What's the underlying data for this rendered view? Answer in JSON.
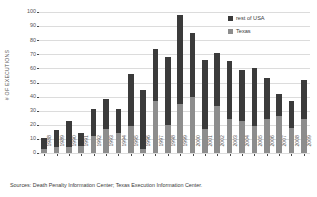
{
  "chart_data": {
    "type": "bar",
    "subtype": "stacked-bar",
    "title": "",
    "xlabel": "",
    "ylabel": "# OF EXECUTIONS",
    "ylim": [
      0,
      100
    ],
    "ytick_step": 10,
    "yticks": [
      100,
      90,
      80,
      70,
      60,
      50,
      40,
      30,
      20,
      10,
      0
    ],
    "grid": "horizontal",
    "legend_position": "top-right-inside",
    "categories": [
      "1988",
      "1989",
      "1990",
      "1991",
      "1992",
      "1993",
      "1994",
      "1995",
      "1996",
      "1997",
      "1998",
      "1999",
      "2000",
      "2001",
      "2002",
      "2003",
      "2004",
      "2005",
      "2006",
      "2007",
      "2008",
      "2009"
    ],
    "series": [
      {
        "name": "Texas",
        "color": "#8d8d8d",
        "values": [
          3,
          4,
          4,
          5,
          12,
          17,
          14,
          19,
          3,
          37,
          20,
          35,
          40,
          17,
          33,
          24,
          23,
          19,
          24,
          26,
          18,
          24
        ]
      },
      {
        "name": "rest of USA",
        "color": "#3b3b3b",
        "values": [
          8,
          12,
          19,
          9,
          19,
          21,
          17,
          37,
          42,
          37,
          48,
          63,
          45,
          49,
          38,
          41,
          36,
          41,
          29,
          16,
          19,
          28
        ]
      }
    ],
    "totals": [
      11,
      16,
      23,
      14,
      31,
      38,
      31,
      56,
      45,
      74,
      68,
      98,
      85,
      66,
      71,
      65,
      59,
      60,
      53,
      42,
      37,
      52
    ],
    "source_note": "Sources: Death Penalty Information Center; Texas Execution Information Center."
  },
  "legend": {
    "items": [
      {
        "label": "rest of USA",
        "color": "#3b3b3b"
      },
      {
        "label": "Texas",
        "color": "#8d8d8d"
      }
    ]
  },
  "axes": {
    "y_title": "# OF EXECUTIONS"
  },
  "footer": {
    "source": "Sources: Death Penalty Information Center; Texas Execution Information Center."
  }
}
